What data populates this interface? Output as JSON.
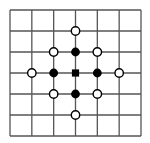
{
  "diagram": {
    "type": "grid-lattice",
    "grid": {
      "columns": 6,
      "rows": 6
    },
    "colors": {
      "line": "#555555",
      "filled": "#000000",
      "open_fill": "#ffffff",
      "stroke": "#000000"
    },
    "center": {
      "shape": "square",
      "col": 3,
      "row": 3
    },
    "filled_points": [
      {
        "col": 3,
        "row": 2
      },
      {
        "col": 2,
        "row": 3
      },
      {
        "col": 4,
        "row": 3
      },
      {
        "col": 3,
        "row": 4
      }
    ],
    "open_points": [
      {
        "col": 3,
        "row": 1
      },
      {
        "col": 2,
        "row": 2
      },
      {
        "col": 4,
        "row": 2
      },
      {
        "col": 1,
        "row": 3
      },
      {
        "col": 5,
        "row": 3
      },
      {
        "col": 2,
        "row": 4
      },
      {
        "col": 4,
        "row": 4
      },
      {
        "col": 3,
        "row": 5
      }
    ]
  }
}
